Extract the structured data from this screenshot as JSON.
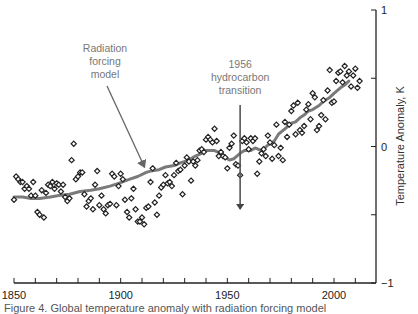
{
  "chart_data": {
    "type": "scatter",
    "title": "",
    "xlabel": "",
    "ylabel": "Temperature Anomaly, K",
    "xlim": [
      1850,
      2015
    ],
    "ylim": [
      -1,
      1
    ],
    "x_ticks": [
      1850,
      1900,
      1950,
      2000
    ],
    "x_minor_step": 10,
    "y_ticks": [
      -1,
      0,
      1
    ],
    "y_minor_step": 0.5,
    "y_axis_side": "right",
    "grid": false,
    "legend": null,
    "series": [
      {
        "name": "Observed temperature anomaly",
        "kind": "scatter",
        "marker": "open-diamond",
        "color": "#222222",
        "points": [
          [
            1850,
            -0.39
          ],
          [
            1851,
            -0.22
          ],
          [
            1852,
            -0.24
          ],
          [
            1853,
            -0.26
          ],
          [
            1854,
            -0.26
          ],
          [
            1855,
            -0.31
          ],
          [
            1856,
            -0.29
          ],
          [
            1857,
            -0.31
          ],
          [
            1858,
            -0.36
          ],
          [
            1859,
            -0.26
          ],
          [
            1860,
            -0.36
          ],
          [
            1861,
            -0.48
          ],
          [
            1862,
            -0.5
          ],
          [
            1863,
            -0.32
          ],
          [
            1864,
            -0.52
          ],
          [
            1865,
            -0.34
          ],
          [
            1866,
            -0.28
          ],
          [
            1867,
            -0.29
          ],
          [
            1868,
            -0.26
          ],
          [
            1869,
            -0.31
          ],
          [
            1870,
            -0.27
          ],
          [
            1871,
            -0.28
          ],
          [
            1872,
            -0.33
          ],
          [
            1873,
            -0.28
          ],
          [
            1874,
            -0.37
          ],
          [
            1875,
            -0.4
          ],
          [
            1876,
            -0.38
          ],
          [
            1877,
            -0.1
          ],
          [
            1878,
            0.02
          ],
          [
            1879,
            -0.24
          ],
          [
            1880,
            -0.22
          ],
          [
            1881,
            -0.19
          ],
          [
            1882,
            -0.19
          ],
          [
            1883,
            -0.35
          ],
          [
            1884,
            -0.44
          ],
          [
            1885,
            -0.4
          ],
          [
            1886,
            -0.38
          ],
          [
            1887,
            -0.46
          ],
          [
            1888,
            -0.28
          ],
          [
            1889,
            -0.18
          ],
          [
            1890,
            -0.43
          ],
          [
            1891,
            -0.36
          ],
          [
            1892,
            -0.46
          ],
          [
            1893,
            -0.49
          ],
          [
            1894,
            -0.43
          ],
          [
            1895,
            -0.42
          ],
          [
            1896,
            -0.2
          ],
          [
            1897,
            -0.22
          ],
          [
            1898,
            -0.43
          ],
          [
            1899,
            -0.29
          ],
          [
            1900,
            -0.2
          ],
          [
            1901,
            -0.24
          ],
          [
            1902,
            -0.39
          ],
          [
            1903,
            -0.48
          ],
          [
            1904,
            -0.52
          ],
          [
            1905,
            -0.38
          ],
          [
            1906,
            -0.31
          ],
          [
            1907,
            -0.46
          ],
          [
            1908,
            -0.55
          ],
          [
            1909,
            -0.55
          ],
          [
            1910,
            -0.52
          ],
          [
            1911,
            -0.57
          ],
          [
            1912,
            -0.45
          ],
          [
            1913,
            -0.44
          ],
          [
            1914,
            -0.26
          ],
          [
            1915,
            -0.16
          ],
          [
            1916,
            -0.41
          ],
          [
            1917,
            -0.5
          ],
          [
            1918,
            -0.36
          ],
          [
            1919,
            -0.3
          ],
          [
            1920,
            -0.28
          ],
          [
            1921,
            -0.21
          ],
          [
            1922,
            -0.27
          ],
          [
            1923,
            -0.26
          ],
          [
            1924,
            -0.29
          ],
          [
            1925,
            -0.21
          ],
          [
            1926,
            -0.12
          ],
          [
            1927,
            -0.18
          ],
          [
            1928,
            -0.17
          ],
          [
            1929,
            -0.35
          ],
          [
            1930,
            -0.14
          ],
          [
            1931,
            -0.08
          ],
          [
            1932,
            -0.11
          ],
          [
            1933,
            -0.25
          ],
          [
            1934,
            -0.11
          ],
          [
            1935,
            -0.14
          ],
          [
            1936,
            -0.1
          ],
          [
            1937,
            -0.03
          ],
          [
            1938,
            -0.02
          ],
          [
            1939,
            -0.04
          ],
          [
            1940,
            0.05
          ],
          [
            1941,
            0.07
          ],
          [
            1942,
            0.05
          ],
          [
            1943,
            0.03
          ],
          [
            1944,
            0.13
          ],
          [
            1945,
            0.04
          ],
          [
            1946,
            -0.07
          ],
          [
            1947,
            -0.04
          ],
          [
            1948,
            -0.07
          ],
          [
            1949,
            -0.08
          ],
          [
            1950,
            -0.16
          ],
          [
            1951,
            -0.01
          ],
          [
            1952,
            0.02
          ],
          [
            1953,
            0.08
          ],
          [
            1954,
            -0.13
          ],
          [
            1955,
            -0.14
          ],
          [
            1956,
            -0.21
          ],
          [
            1957,
            0.04
          ],
          [
            1958,
            0.06
          ],
          [
            1959,
            0.03
          ],
          [
            1960,
            -0.02
          ],
          [
            1961,
            0.06
          ],
          [
            1962,
            0.04
          ],
          [
            1963,
            0.06
          ],
          [
            1964,
            -0.2
          ],
          [
            1965,
            -0.11
          ],
          [
            1966,
            -0.05
          ],
          [
            1967,
            -0.02
          ],
          [
            1968,
            -0.07
          ],
          [
            1969,
            0.08
          ],
          [
            1970,
            0.03
          ],
          [
            1971,
            -0.09
          ],
          [
            1972,
            0.01
          ],
          [
            1973,
            0.16
          ],
          [
            1974,
            -0.07
          ],
          [
            1975,
            -0.01
          ],
          [
            1976,
            -0.1
          ],
          [
            1977,
            0.18
          ],
          [
            1978,
            0.07
          ],
          [
            1979,
            0.16
          ],
          [
            1980,
            0.26
          ],
          [
            1981,
            0.3
          ],
          [
            1982,
            0.09
          ],
          [
            1983,
            0.32
          ],
          [
            1984,
            0.12
          ],
          [
            1985,
            0.1
          ],
          [
            1986,
            0.15
          ],
          [
            1987,
            0.27
          ],
          [
            1988,
            0.31
          ],
          [
            1989,
            0.2
          ],
          [
            1990,
            0.39
          ],
          [
            1991,
            0.36
          ],
          [
            1992,
            0.12
          ],
          [
            1993,
            0.15
          ],
          [
            1994,
            0.23
          ],
          [
            1995,
            0.34
          ],
          [
            1996,
            0.2
          ],
          [
            1997,
            0.41
          ],
          [
            1998,
            0.56
          ],
          [
            1999,
            0.32
          ],
          [
            2000,
            0.33
          ],
          [
            2001,
            0.48
          ],
          [
            2002,
            0.54
          ],
          [
            2003,
            0.55
          ],
          [
            2004,
            0.47
          ],
          [
            2005,
            0.59
          ],
          [
            2006,
            0.52
          ],
          [
            2007,
            0.55
          ],
          [
            2008,
            0.44
          ],
          [
            2009,
            0.52
          ],
          [
            2010,
            0.57
          ],
          [
            2011,
            0.43
          ],
          [
            2012,
            0.48
          ]
        ]
      },
      {
        "name": "Radiation forcing model",
        "kind": "line",
        "color": "#7a7a7a",
        "points": [
          [
            1850,
            -0.37
          ],
          [
            1854,
            -0.37
          ],
          [
            1858,
            -0.38
          ],
          [
            1862,
            -0.38
          ],
          [
            1867,
            -0.37
          ],
          [
            1871,
            -0.36
          ],
          [
            1876,
            -0.35
          ],
          [
            1881,
            -0.33
          ],
          [
            1886,
            -0.32
          ],
          [
            1890,
            -0.31
          ],
          [
            1895,
            -0.29
          ],
          [
            1899,
            -0.27
          ],
          [
            1904,
            -0.24
          ],
          [
            1908,
            -0.22
          ],
          [
            1912,
            -0.19
          ],
          [
            1914,
            -0.18
          ],
          [
            1918,
            -0.17
          ],
          [
            1921,
            -0.15
          ],
          [
            1925,
            -0.14
          ],
          [
            1928,
            -0.12
          ],
          [
            1932,
            -0.1
          ],
          [
            1935,
            -0.07
          ],
          [
            1938,
            -0.05
          ],
          [
            1940,
            -0.03
          ],
          [
            1944,
            -0.03
          ],
          [
            1947,
            -0.05
          ],
          [
            1949,
            -0.08
          ],
          [
            1951,
            -0.1
          ],
          [
            1953,
            -0.09
          ],
          [
            1956,
            -0.05
          ],
          [
            1958,
            -0.03
          ],
          [
            1961,
            -0.03
          ],
          [
            1963,
            -0.01
          ],
          [
            1966,
            -0.03
          ],
          [
            1969,
            0.01
          ],
          [
            1972,
            0.04
          ],
          [
            1974,
            0.09
          ],
          [
            1977,
            0.13
          ],
          [
            1980,
            0.17
          ],
          [
            1982,
            0.18
          ],
          [
            1984,
            0.21
          ],
          [
            1986,
            0.23
          ],
          [
            1988,
            0.26
          ],
          [
            1990,
            0.27
          ],
          [
            1993,
            0.3
          ],
          [
            1995,
            0.33
          ],
          [
            1998,
            0.36
          ],
          [
            2000,
            0.39
          ],
          [
            2003,
            0.43
          ],
          [
            2005,
            0.45
          ],
          [
            2007,
            0.48
          ]
        ]
      }
    ],
    "annotations": [
      {
        "text_lines": [
          "Radiation",
          "forcing",
          "model"
        ],
        "points_to": [
          1911,
          -0.16
        ],
        "arrow": "diagonal"
      },
      {
        "text_lines": [
          "1956",
          "hydrocarbon",
          "transition"
        ],
        "points_to": [
          1956,
          -0.37
        ],
        "arrow": "vertical",
        "x_value": 1956
      }
    ]
  },
  "caption": "Figure 4. Global temperature anomaly with radiation forcing model"
}
